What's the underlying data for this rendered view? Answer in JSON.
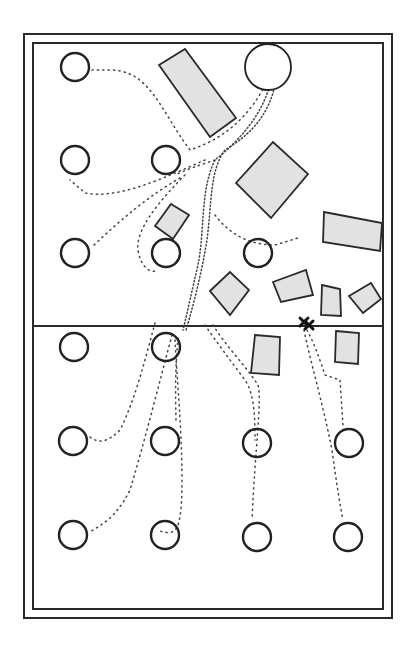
{
  "diagram": {
    "title": "",
    "canvas": {
      "width": 411,
      "height": 653
    },
    "colors": {
      "background": "#ffffff",
      "stroke": "#2a2a2a",
      "obstacle_fill": "#e2e2e2",
      "path_dots": "#444444"
    },
    "outer_frame": {
      "x": 24,
      "y": 34,
      "w": 368,
      "h": 584
    },
    "inner_frame": {
      "x": 33,
      "y": 43,
      "w": 350,
      "h": 566
    },
    "divider_line": {
      "x1": 33,
      "y1": 326,
      "x2": 383,
      "y2": 326
    },
    "start_marker": {
      "icon": "x-cross-icon",
      "x": 305,
      "y": 323
    },
    "goal_circle": {
      "cx": 268,
      "cy": 67,
      "r": 23
    },
    "targets": [
      {
        "row": 1,
        "col": 1,
        "cx": 75,
        "cy": 67,
        "r": 14
      },
      {
        "row": 2,
        "col": 1,
        "cx": 75,
        "cy": 160,
        "r": 14
      },
      {
        "row": 2,
        "col": 2,
        "cx": 166,
        "cy": 160,
        "r": 14
      },
      {
        "row": 3,
        "col": 1,
        "cx": 75,
        "cy": 253,
        "r": 14
      },
      {
        "row": 3,
        "col": 2,
        "cx": 166,
        "cy": 253,
        "r": 14
      },
      {
        "row": 3,
        "col": 3,
        "cx": 258,
        "cy": 253,
        "r": 14
      },
      {
        "row": 4,
        "col": 1,
        "cx": 74,
        "cy": 347,
        "r": 14
      },
      {
        "row": 4,
        "col": 2,
        "cx": 166,
        "cy": 347,
        "r": 14
      },
      {
        "row": 5,
        "col": 1,
        "cx": 73,
        "cy": 441,
        "r": 14
      },
      {
        "row": 5,
        "col": 2,
        "cx": 165,
        "cy": 441,
        "r": 14
      },
      {
        "row": 5,
        "col": 3,
        "cx": 257,
        "cy": 443,
        "r": 14
      },
      {
        "row": 5,
        "col": 4,
        "cx": 349,
        "cy": 443,
        "r": 14
      },
      {
        "row": 6,
        "col": 1,
        "cx": 73,
        "cy": 535,
        "r": 14
      },
      {
        "row": 6,
        "col": 2,
        "cx": 165,
        "cy": 535,
        "r": 14
      },
      {
        "row": 6,
        "col": 3,
        "cx": 257,
        "cy": 537,
        "r": 14
      },
      {
        "row": 6,
        "col": 4,
        "cx": 348,
        "cy": 537,
        "r": 14
      }
    ],
    "obstacles": [
      {
        "id": "long-bar-top",
        "points": "159,65 185,49 236,118 210,137"
      },
      {
        "id": "big-diamond",
        "points": "236,183 273,142 308,174 271,218"
      },
      {
        "id": "small-tilted-left",
        "points": "155,226 171,204 189,215 173,239"
      },
      {
        "id": "right-wide-rect",
        "points": "324,212 382,223 380,251 323,242"
      },
      {
        "id": "mid-diamond",
        "points": "210,291 230,272 249,290 230,315"
      },
      {
        "id": "mid-rect",
        "points": "273,282 306,270 313,295 281,302"
      },
      {
        "id": "narrow-rect",
        "points": "322,285 340,289 341,316 321,315"
      },
      {
        "id": "small-diamond-right",
        "points": "349,296 371,283 381,299 363,313"
      },
      {
        "id": "lower-rect-left",
        "points": "255,335 280,337 279,375 251,373"
      },
      {
        "id": "lower-rect-right",
        "points": "336,331 359,333 358,364 335,362"
      }
    ],
    "paths": [
      {
        "id": "goal-to-r1c1",
        "dense": false,
        "d": "M 270 75 C 250 120 220 140 190 150 C 160 110 150 70 110 70 L 90 70"
      },
      {
        "id": "goal-trunk",
        "dense": true,
        "d": "M 272 72 C 268 110 240 140 215 160 C 200 190 205 230 198 265 C 192 290 188 310 183 330"
      },
      {
        "id": "goal-trunk-b",
        "dense": true,
        "d": "M 276 80 C 270 115 250 135 225 150 C 210 170 212 200 207 240 C 202 270 195 300 186 330"
      },
      {
        "id": "branch-r2c1",
        "dense": false,
        "d": "M 205 160 C 170 175 120 200 85 193 L 70 180"
      },
      {
        "id": "branch-r3c1",
        "dense": false,
        "d": "M 180 178 C 150 195 120 220 92 247"
      },
      {
        "id": "branch-r3c2",
        "dense": false,
        "d": "M 185 175 C 160 200 135 230 138 250 C 140 265 150 275 158 270"
      },
      {
        "id": "branch-r3c3",
        "dense": false,
        "d": "M 215 215 C 230 235 250 245 275 245 L 298 238"
      },
      {
        "id": "branch-r2c2",
        "dense": false,
        "d": "M 215 160 C 200 165 185 170 175 175"
      },
      {
        "id": "lower-r5c1",
        "dense": false,
        "d": "M 155 323 C 145 360 135 400 120 430 C 110 440 100 445 90 437"
      },
      {
        "id": "lower-r6c1",
        "dense": false,
        "d": "M 172 335 C 160 380 145 440 130 490 C 115 520 100 525 90 532"
      },
      {
        "id": "lower-r6c2",
        "dense": false,
        "d": "M 175 340 C 177 380 182 430 182 480 C 182 510 180 530 172 532 C 165 533 160 532 160 530"
      },
      {
        "id": "lower-r5c2",
        "dense": false,
        "d": "M 178 338 C 176 360 175 380 176 420"
      },
      {
        "id": "lower-r5c3",
        "dense": false,
        "d": "M 205 325 C 215 340 230 360 245 380 C 255 395 255 420 255 440"
      },
      {
        "id": "lower-r6c3",
        "dense": false,
        "d": "M 213 325 C 225 345 245 365 258 385 C 262 400 255 450 252 520"
      },
      {
        "id": "start-to-r5c4",
        "dense": false,
        "d": "M 307 330 C 315 345 320 360 325 375 L 340 380 L 343 425"
      },
      {
        "id": "start-to-r6c4",
        "dense": false,
        "d": "M 304 330 C 310 360 322 400 332 450 C 336 480 340 505 343 520"
      }
    ]
  }
}
